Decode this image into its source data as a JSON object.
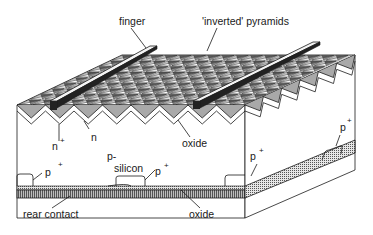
{
  "diagram": {
    "labels": {
      "finger": "finger",
      "inverted_pyramids": "'inverted' pyramids",
      "oxide_front": "oxide",
      "n_plus": "n",
      "n_plus_sup": "+",
      "n": "n",
      "p_minus": "p-",
      "silicon": "silicon",
      "p_plus_left": "p",
      "p_plus_left_sup": "+",
      "p_plus_center": "p",
      "p_plus_center_sup": "+",
      "p_plus_side": "p",
      "p_plus_side_sup": "+",
      "p_plus_top_right": "p",
      "p_plus_top_right_sup": "+",
      "rear_contact": "rear contact",
      "oxide_rear": "oxide"
    },
    "colors": {
      "ink": "#1a1a1a",
      "finger_top": "#f4f4f4",
      "finger_side": "#222222",
      "oxide_fill": "#9a9a9a",
      "rear_contact_fill": "#8c8c8c",
      "background": "#ffffff"
    }
  }
}
